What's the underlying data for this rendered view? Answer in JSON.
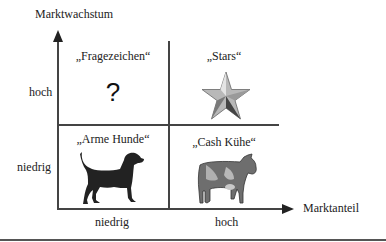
{
  "diagram": {
    "y_axis": {
      "label": "Marktwachstum",
      "ticks": [
        "hoch",
        "niedrig"
      ]
    },
    "x_axis": {
      "label": "Marktanteil",
      "ticks": [
        "niedrig",
        "hoch"
      ]
    },
    "quadrants": [
      {
        "position": "top-left",
        "label": "„Fragezeichen“",
        "icon": "question-mark-icon",
        "symbol": "?"
      },
      {
        "position": "top-right",
        "label": "„Stars“",
        "icon": "star-icon"
      },
      {
        "position": "bottom-left",
        "label": "„Arme Hunde“",
        "icon": "dog-icon"
      },
      {
        "position": "bottom-right",
        "label": "„Cash Kühe“",
        "icon": "cow-icon"
      }
    ],
    "colors": {
      "line": "#444444",
      "star_light": "#c8c8c8",
      "star_dark": "#555555",
      "dog": "#2a2a2a",
      "cow": "#707070"
    }
  }
}
